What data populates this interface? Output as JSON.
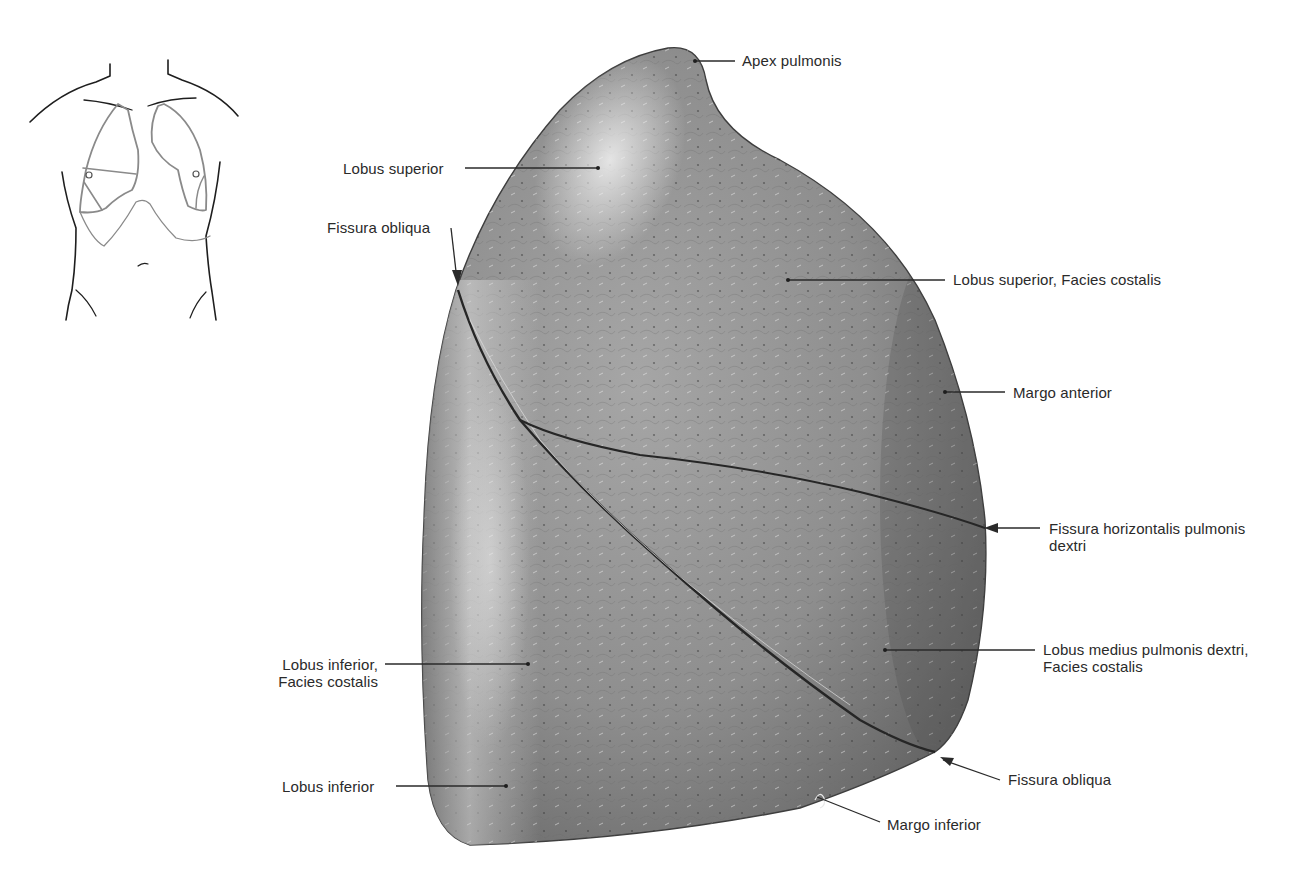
{
  "figure": {
    "colors": {
      "background": "#ffffff",
      "lung_light": "#c9c9c9",
      "lung_mid": "#8e8e8e",
      "lung_dark": "#5a5a5a",
      "fissure": "#262626",
      "leader_line": "#2a2a2a",
      "label_text": "#2a2a2a",
      "orientation_outline_body": "#1e1e1e",
      "orientation_outline_lung": "#8a8a8a"
    }
  },
  "orientation_sketch": {
    "description": "Torso outline with lung projection, right lung fissures indicated"
  },
  "labels": [
    {
      "id": "apex-pulmonis",
      "text": "Apex pulmonis"
    },
    {
      "id": "lobus-superior",
      "text": "Lobus superior"
    },
    {
      "id": "fissura-obliqua-top",
      "text": "Fissura obliqua"
    },
    {
      "id": "lobus-superior-facies-costalis",
      "text": "Lobus superior, Facies costalis"
    },
    {
      "id": "margo-anterior",
      "text": "Margo anterior"
    },
    {
      "id": "fissura-horizontalis",
      "line1": "Fissura horizontalis pulmonis",
      "line2": "dextri"
    },
    {
      "id": "lobus-medius",
      "line1": "Lobus medius pulmonis dextri,",
      "line2": "Facies costalis"
    },
    {
      "id": "lobus-inferior-facies-costalis",
      "line1": "Lobus inferior,",
      "line2": "Facies costalis"
    },
    {
      "id": "lobus-inferior",
      "text": "Lobus inferior"
    },
    {
      "id": "fissura-obliqua-bottom",
      "text": "Fissura obliqua"
    },
    {
      "id": "margo-inferior",
      "text": "Margo inferior"
    }
  ]
}
